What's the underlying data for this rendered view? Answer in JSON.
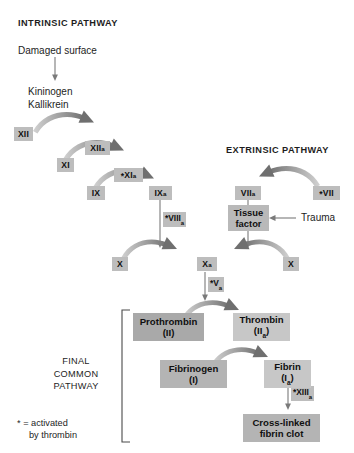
{
  "diagram": {
    "headings": {
      "intrinsic": "INTRINSIC PATHWAY",
      "extrinsic": "EXTRINSIC PATHWAY",
      "final_common": "FINAL\nCOMMON\nPATHWAY",
      "final_common_lines": [
        "FINAL",
        "COMMON",
        "PATHWAY"
      ]
    },
    "labels": {
      "damaged_surface": "Damaged surface",
      "kininogen": "Kininogen",
      "kallikrein": "Kallikrein",
      "trauma": "Trauma"
    },
    "footnote": {
      "line1": "* = activated",
      "line2": "by thrombin"
    },
    "factors": {
      "xii": "XII",
      "xiia": "XII",
      "xiia_sub": "a",
      "xi": "XI",
      "xia": "XI",
      "xia_sub": "a",
      "xia_star": "*",
      "ix": "IX",
      "ixa": "IX",
      "ixa_sub": "a",
      "viia": "VII",
      "viia_sub": "a",
      "vii": "VII",
      "vii_star": "*",
      "x_left": "X",
      "x_right": "X",
      "xa": "X",
      "xa_sub": "a"
    },
    "cofactors": {
      "viiia": "VIII",
      "viiia_sub": "a",
      "viiia_star": "*",
      "va": "V",
      "va_sub": "a",
      "va_star": "*",
      "xiiia": "XIII",
      "xiiia_sub": "a",
      "xiiia_star": "*"
    },
    "boxes": {
      "tissue_factor_line1": "Tissue",
      "tissue_factor_line2": "factor",
      "prothrombin_name": "Prothrombin",
      "prothrombin_num": "(II)",
      "thrombin_name": "Thrombin",
      "thrombin_num_pre": "(II",
      "thrombin_num_sub": "a",
      "thrombin_num_post": ")",
      "fibrinogen_name": "Fibrinogen",
      "fibrinogen_num": "(I)",
      "fibrin_name": "Fibrin",
      "fibrin_num_pre": "(I",
      "fibrin_num_sub": "a",
      "fibrin_num_post": ")",
      "clot_line1": "Cross-linked",
      "clot_line2": "fibrin clot"
    },
    "colors": {
      "background": "#ffffff",
      "text": "#1d1d1d",
      "chip_gray": "#bdbdbd",
      "box_dark_gray": "#a9a9a9",
      "box_light_gray": "#c7c7c7",
      "arrow_gray": "#8e8e8e",
      "line_gray": "#7a7a7a"
    }
  }
}
